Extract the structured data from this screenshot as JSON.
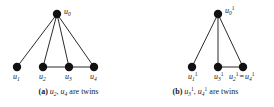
{
  "figure": {
    "panels": [
      {
        "id": "a",
        "caption_tag": "(a)",
        "caption_math_1": "u",
        "caption_math_1_sub": "2",
        "caption_math_2": "u",
        "caption_math_2_sub": "4",
        "caption_text": "are twins",
        "caption_full": "(a) u2, u4 are twins",
        "apex": {
          "label_base": "u",
          "label_sub": "0",
          "label_sup": "",
          "cx": 57,
          "cy": 14,
          "r": 4.2
        },
        "vertices": [
          {
            "label_base": "u",
            "label_sub": "1",
            "label_sup": "",
            "cx": 17,
            "cy": 67,
            "r": 4.2
          },
          {
            "label_base": "u",
            "label_sub": "2",
            "label_sup": "",
            "cx": 43,
            "cy": 67,
            "r": 4.2
          },
          {
            "label_base": "u",
            "label_sub": "3",
            "label_sup": "",
            "cx": 69,
            "cy": 67,
            "r": 4.2
          },
          {
            "label_base": "u",
            "label_sub": "4",
            "label_sup": "",
            "cx": 94,
            "cy": 67,
            "r": 4.2
          }
        ]
      },
      {
        "id": "b",
        "caption_tag": "(b)",
        "caption_math_1": "u",
        "caption_math_1_sub": "3",
        "caption_math_1_sup": "1",
        "caption_math_2": "u",
        "caption_math_2_sub": "4",
        "caption_math_2_sup": "1",
        "caption_text": "are twins",
        "caption_full": "(b) u3^1, u4^1 are twins",
        "apex": {
          "label_base": "u",
          "label_sub": "0",
          "label_sup": "1",
          "cx": 81,
          "cy": 14,
          "r": 4.2
        },
        "vertices": [
          {
            "label_base": "u",
            "label_sub": "1",
            "label_sup": "1",
            "cx": 55,
            "cy": 67,
            "r": 4.2
          },
          {
            "label_base": "u",
            "label_sub": "3",
            "label_sup": "1",
            "cx": 81,
            "cy": 67,
            "r": 4.2
          },
          {
            "label_base": "u",
            "label_sub": "2",
            "label_sup": "1",
            "cx": 106,
            "cy": 67,
            "r": 4.2,
            "merged": true,
            "merged_base": "u",
            "merged_sub": "4",
            "merged_sup": "1",
            "eq": "="
          }
        ]
      }
    ],
    "colors": {
      "vertex": "#111111",
      "edge": "#2b2b2b",
      "background": "#ffffff",
      "text": "#1a1a1a"
    }
  }
}
